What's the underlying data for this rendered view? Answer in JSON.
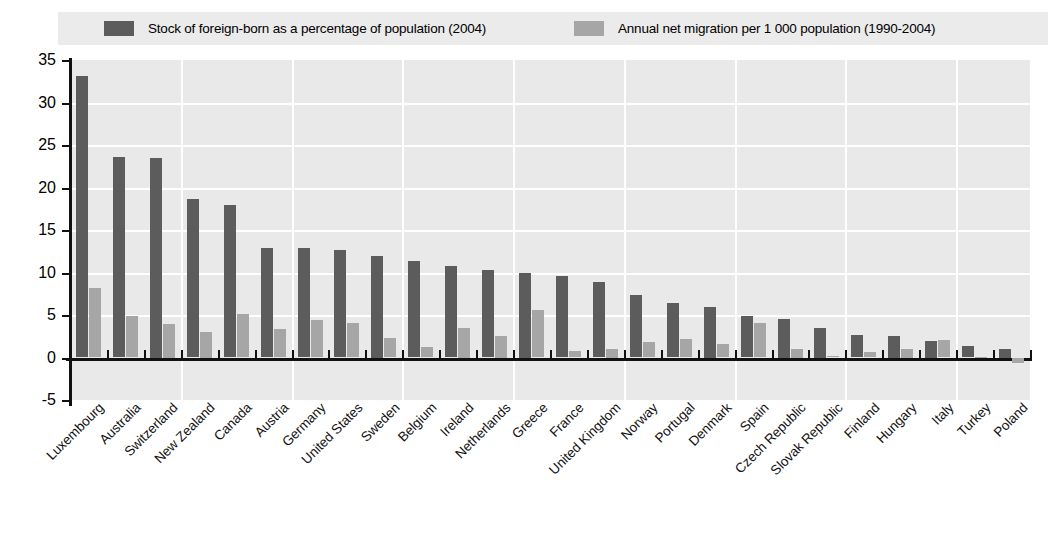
{
  "legend": {
    "items": [
      {
        "label": "Stock of foreign-born as a percentage of population (2004)",
        "color": "#5c5c5c",
        "name": "legend-stock-foreign-born"
      },
      {
        "label": "Annual net migration per 1 000 population (1990-2004)",
        "color": "#a6a6a6",
        "name": "legend-annual-net-migration"
      }
    ]
  },
  "axes": {
    "y_ticks": [
      "35",
      "30",
      "25",
      "20",
      "15",
      "10",
      "5",
      "0",
      "-5"
    ],
    "y_min": -5,
    "y_max": 35,
    "y_step": 5
  },
  "colors": {
    "series_1": "#5c5c5c",
    "series_2": "#a6a6a6",
    "plot_background": "#e9e9e9",
    "gridline": "#ffffff",
    "axis": "#111111",
    "legend_background": "#ebebeb"
  },
  "chart_data": {
    "type": "bar",
    "title": "",
    "xlabel": "",
    "ylabel": "",
    "ylim": [
      -5,
      35
    ],
    "grid": true,
    "legend_position": "top",
    "categories": [
      "Luxembourg",
      "Australia",
      "Switzerland",
      "New Zealand",
      "Canada",
      "Austria",
      "Germany",
      "United States",
      "Sweden",
      "Belgium",
      "Ireland",
      "Netherlands",
      "Greece",
      "France",
      "United Kingdom",
      "Norway",
      "Portugal",
      "Denmark",
      "Spain",
      "Czech Republic",
      "Slovak Republic",
      "Finland",
      "Hungary",
      "Italy",
      "Turkey",
      "Poland"
    ],
    "series": [
      {
        "name": "Stock of foreign-born as a percentage of population (2004)",
        "color": "#5c5c5c",
        "values": [
          33.1,
          23.6,
          23.5,
          18.6,
          17.9,
          12.9,
          12.9,
          12.6,
          12.0,
          11.3,
          10.8,
          10.3,
          10.0,
          9.6,
          8.9,
          7.4,
          6.4,
          6.0,
          4.9,
          4.5,
          3.5,
          2.7,
          2.5,
          2.0,
          1.4,
          1.0
        ]
      },
      {
        "name": "Annual net migration per 1 000 population (1990-2004)",
        "color": "#a6a6a6",
        "values": [
          8.2,
          4.9,
          4.0,
          3.0,
          5.1,
          3.4,
          4.4,
          4.1,
          2.3,
          1.2,
          3.5,
          2.5,
          5.6,
          0.8,
          1.0,
          1.8,
          2.2,
          1.6,
          4.1,
          1.0,
          0.2,
          0.6,
          1.0,
          2.1,
          0.1,
          -0.6
        ]
      }
    ]
  }
}
